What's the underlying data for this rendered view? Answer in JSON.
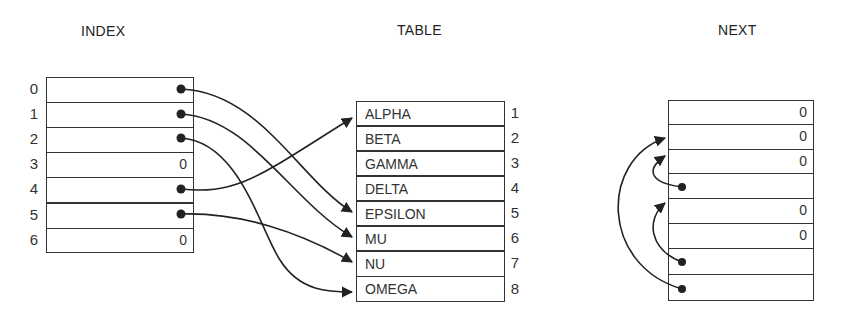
{
  "titles": {
    "index": "INDEX",
    "table": "TABLE",
    "next": "NEXT"
  },
  "index": {
    "rows": [
      {
        "label": "0",
        "value": "",
        "pointer": true,
        "target": "EPSILON"
      },
      {
        "label": "1",
        "value": "",
        "pointer": true,
        "target": "MU"
      },
      {
        "label": "2",
        "value": "",
        "pointer": true,
        "target": "OMEGA"
      },
      {
        "label": "3",
        "value": "0",
        "pointer": false
      },
      {
        "label": "4",
        "value": "",
        "pointer": true,
        "target": "ALPHA"
      },
      {
        "label": "5",
        "value": "",
        "pointer": true,
        "target": "NU"
      },
      {
        "label": "6",
        "value": "0",
        "pointer": false
      }
    ]
  },
  "table": {
    "rows": [
      {
        "name": "ALPHA",
        "num": "1"
      },
      {
        "name": "BETA",
        "num": "2"
      },
      {
        "name": "GAMMA",
        "num": "3"
      },
      {
        "name": "DELTA",
        "num": "4"
      },
      {
        "name": "EPSILON",
        "num": "5"
      },
      {
        "name": "MU",
        "num": "6"
      },
      {
        "name": "NU",
        "num": "7"
      },
      {
        "name": "OMEGA",
        "num": "8"
      }
    ]
  },
  "next": {
    "rows": [
      {
        "value": "0",
        "pointer": false
      },
      {
        "value": "0",
        "pointer": false
      },
      {
        "value": "0",
        "pointer": false
      },
      {
        "value": "",
        "pointer": true,
        "target_row": 3
      },
      {
        "value": "0",
        "pointer": false
      },
      {
        "value": "0",
        "pointer": false
      },
      {
        "value": "",
        "pointer": true,
        "target_row": 5
      },
      {
        "value": "",
        "pointer": true,
        "target_row": 2
      }
    ]
  },
  "colors": {
    "stroke": "#222222",
    "text": "#333333",
    "background": "#ffffff"
  }
}
